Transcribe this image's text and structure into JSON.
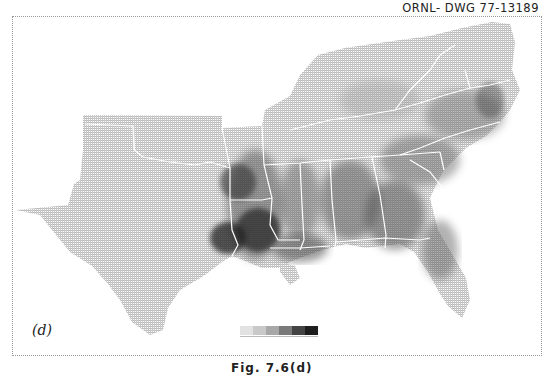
{
  "figure": {
    "drawing_id": "ORNL- DWG  77-13189",
    "panel_label": "(d)",
    "caption": "Fig. 7.6(d)"
  },
  "map": {
    "region": "Southeastern United States",
    "states_outlined": [
      "Texas",
      "Oklahoma",
      "Arkansas",
      "Louisiana",
      "Mississippi",
      "Alabama",
      "Georgia",
      "Florida",
      "Tennessee",
      "Kentucky",
      "South Carolina",
      "North Carolina",
      "Virginia",
      "West Virginia",
      "Maryland"
    ],
    "border_color": "#ffffff",
    "shading": "grayscale dot-matrix density"
  },
  "legend": {
    "levels": [
      {
        "level": 1,
        "color": "#e2e2e2"
      },
      {
        "level": 2,
        "color": "#c9c9c9"
      },
      {
        "level": 3,
        "color": "#a8a8a8"
      },
      {
        "level": 4,
        "color": "#7a7a7a"
      },
      {
        "level": 5,
        "color": "#444444"
      },
      {
        "level": 6,
        "color": "#1e1e1e"
      }
    ]
  }
}
